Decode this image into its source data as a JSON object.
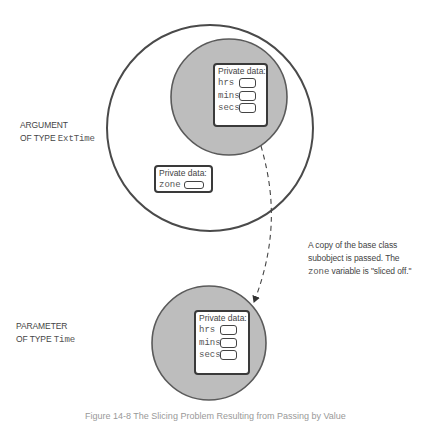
{
  "diagram": {
    "argument_label": {
      "line1": "ARGUMENT",
      "line2_prefix": "OF TYPE ",
      "line2_type": "ExtTime"
    },
    "parameter_label": {
      "line1": "PARAMETER",
      "line2_prefix": "OF TYPE ",
      "line2_type": "Time"
    },
    "argument_object": {
      "base_subobject": {
        "title": "Private data:",
        "fields": [
          "hrs",
          "mins",
          "secs"
        ]
      },
      "derived_part": {
        "title": "Private data:",
        "fields": [
          "zone"
        ]
      }
    },
    "parameter_object": {
      "title": "Private data:",
      "fields": [
        "hrs",
        "mins",
        "secs"
      ]
    },
    "annotation": {
      "line1": "A copy of the base class",
      "line2": "subobject is passed. The",
      "line3_code": "zone",
      "line3_rest": " variable is \"sliced off.\""
    },
    "colors": {
      "base_fill": "#bdbdbd",
      "stroke": "#555555",
      "outer_stroke": "#4a4a4a"
    }
  },
  "caption": "Figure 14-8   The Slicing Problem Resulting from Passing by Value"
}
